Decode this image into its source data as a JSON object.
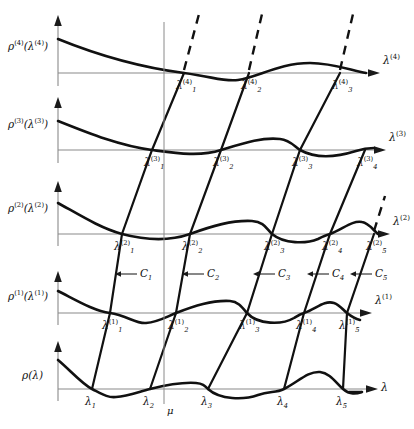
{
  "figure": {
    "type": "diagram",
    "axis_color": "#8a8a8a",
    "curve_color": "#111111",
    "rows": [
      {
        "id": "row4",
        "y_label": "ρ⁽⁴⁾(λ⁽⁴⁾)",
        "y_label_html": "<i>ρ</i><sup>(4)</sup>(<i>λ</i><sup>(4)</sup>)",
        "x_label": "λ⁽⁴⁾",
        "x_label_html": "<i>λ</i><sup>(4)</sup>",
        "baseline_y": 73,
        "roots": [
          {
            "label_html": "<i>λ</i><sup>(4)</sup><sub>1</sub>",
            "x": 184
          },
          {
            "label_html": "<i>λ</i><sup>(4)</sup><sub>2</sub>",
            "x": 249
          },
          {
            "label_html": "<i>λ</i><sup>(4)</sup><sub>3</sub>",
            "x": 340
          }
        ]
      },
      {
        "id": "row3",
        "y_label": "ρ⁽³⁾(λ⁽³⁾)",
        "y_label_html": "<i>ρ</i><sup>(3)</sup>(<i>λ</i><sup>(3)</sup>)",
        "x_label": "λ⁽³⁾",
        "x_label_html": "<i>λ</i><sup>(3)</sup>",
        "baseline_y": 150,
        "roots": [
          {
            "label_html": "<i>λ</i><sup>(3)</sup><sub>1</sub>",
            "x": 152
          },
          {
            "label_html": "<i>λ</i><sup>(3)</sup><sub>2</sub>",
            "x": 221
          },
          {
            "label_html": "<i>λ</i><sup>(3)</sup><sub>3</sub>",
            "x": 300
          },
          {
            "label_html": "<i>λ</i><sup>(3)</sup><sub>4</sub>",
            "x": 365
          }
        ]
      },
      {
        "id": "row2",
        "y_label": "ρ⁽²⁾(λ⁽²⁾)",
        "y_label_html": "<i>ρ</i><sup>(2)</sup>(<i>λ</i><sup>(2)</sup>)",
        "x_label": "λ⁽²⁾",
        "x_label_html": "<i>λ</i><sup>(2)</sup>",
        "baseline_y": 234,
        "roots": [
          {
            "label_html": "<i>λ</i><sup>(2)</sup><sub>1</sub>",
            "x": 122
          },
          {
            "label_html": "<i>λ</i><sup>(2)</sup><sub>2</sub>",
            "x": 190
          },
          {
            "label_html": "<i>λ</i><sup>(2)</sup><sub>3</sub>",
            "x": 272
          },
          {
            "label_html": "<i>λ</i><sup>(2)</sup><sub>4</sub>",
            "x": 330
          },
          {
            "label_html": "<i>λ</i><sup>(2)</sup><sub>5</sub>",
            "x": 374
          }
        ]
      },
      {
        "id": "row1",
        "y_label": "ρ⁽¹⁾(λ⁽¹⁾)",
        "y_label_html": "<i>ρ</i><sup>(1)</sup>(<i>λ</i><sup>(1)</sup>)",
        "x_label": "λ⁽¹⁾",
        "x_label_html": "<i>λ</i><sup>(1)</sup>",
        "baseline_y": 313,
        "roots": [
          {
            "label_html": "<i>λ</i><sup>(1)</sup><sub>1</sub>",
            "x": 110
          },
          {
            "label_html": "<i>λ</i><sup>(1)</sup><sub>2</sub>",
            "x": 176
          },
          {
            "label_html": "<i>λ</i><sup>(1)</sup><sub>3</sub>",
            "x": 247
          },
          {
            "label_html": "<i>λ</i><sup>(1)</sup><sub>4</sub>",
            "x": 304
          },
          {
            "label_html": "<i>λ</i><sup>(1)</sup><sub>5</sub>",
            "x": 347
          }
        ]
      },
      {
        "id": "row0",
        "y_label": "ρ(λ)",
        "y_label_html": "<i>ρ</i>(<i>λ</i>)",
        "x_label": "λ",
        "x_label_html": "<i>λ</i>",
        "baseline_y": 389,
        "roots": [
          {
            "label_html": "<i>λ</i><sub>1</sub>",
            "x": 92
          },
          {
            "label_html": "<i>λ</i><sub>2</sub>",
            "x": 150
          },
          {
            "label_html": "<i>λ</i><sub>3</sub>",
            "x": 208
          },
          {
            "label_html": "<i>λ</i><sub>4</sub>",
            "x": 284
          },
          {
            "label_html": "<i>λ</i><sub>5</sub>",
            "x": 343
          }
        ]
      }
    ],
    "branch_labels": [
      {
        "label_html": "<i>C</i><sub>1</sub>",
        "x": 140,
        "y": 277
      },
      {
        "label_html": "<i>C</i><sub>2</sub>",
        "x": 207,
        "y": 277
      },
      {
        "label_html": "<i>C</i><sub>3</sub>",
        "x": 278,
        "y": 277
      },
      {
        "label_html": "<i>C</i><sub>4</sub>",
        "x": 332,
        "y": 277
      },
      {
        "label_html": "<i>C</i><sub>5</sub>",
        "x": 375,
        "y": 277
      }
    ],
    "mu_label": {
      "label_html": "<i>μ</i>",
      "x": 164,
      "y": 410
    },
    "mu_line_x": 164,
    "y_axis_x": 58
  }
}
